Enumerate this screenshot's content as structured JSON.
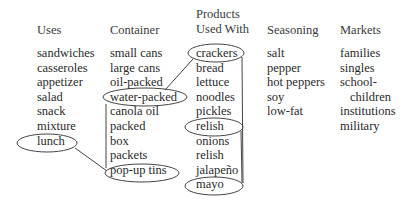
{
  "diagram": {
    "headers": {
      "uses": "Uses",
      "container": "Container",
      "products_line1": "Products",
      "products_line2": "Used With",
      "seasoning": "Seasoning",
      "markets": "Markets"
    },
    "columns": {
      "uses": [
        "sandwiches",
        "casseroles",
        "appetizer",
        "salad",
        "snack",
        "mixture",
        "lunch"
      ],
      "container": [
        "small cans",
        "large cans",
        "oil-packed",
        "water-packed",
        "canola oil",
        "packed",
        "box",
        "packets",
        "pop-up tins"
      ],
      "products": [
        "crackers",
        "bread",
        "lettuce",
        "noodles",
        "pickles",
        "relish",
        "onions",
        "relish",
        "jalapeño",
        "mayo"
      ],
      "seasoning": [
        "salt",
        "pepper",
        "hot peppers",
        "soy",
        "low-fat"
      ],
      "markets": [
        "families",
        "singles",
        "school-",
        "children",
        "institutions",
        "military"
      ]
    },
    "circled_items": [
      "crackers",
      "water-packed",
      "lunch",
      "pop-up tins",
      "relish",
      "mayo"
    ],
    "connections": [
      [
        "crackers",
        "water-packed"
      ],
      [
        "water-packed",
        "pop-up tins"
      ],
      [
        "lunch",
        "pop-up tins"
      ],
      [
        "crackers",
        "mayo"
      ],
      [
        "relish",
        "mayo"
      ]
    ]
  }
}
